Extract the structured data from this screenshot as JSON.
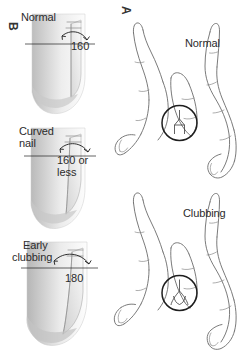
{
  "figure": {
    "background_color": "#ffffff",
    "line_color": "#6b6b6b",
    "text_color": "#2b2b2b",
    "highlight_color": "#1e1e1e"
  },
  "panels": [
    {
      "letter": "A",
      "name": "schamroth-window-test",
      "items": [
        {
          "label": "Normal",
          "name": "normal-hands"
        },
        {
          "label": "Clubbing",
          "name": "clubbing-hands"
        }
      ]
    },
    {
      "letter": "B",
      "name": "nail-profile-angles",
      "items": [
        {
          "label": "Normal",
          "angle": "160",
          "name": "normal-profile"
        },
        {
          "label_line1": "Curved",
          "label_line2": "nail",
          "angle_line1": "160 or",
          "angle_line2": "less",
          "name": "curved-nail-profile"
        },
        {
          "label_line1": "Early",
          "label_line2": "clubbing",
          "angle": "180",
          "name": "early-clubbing-profile"
        }
      ]
    }
  ]
}
